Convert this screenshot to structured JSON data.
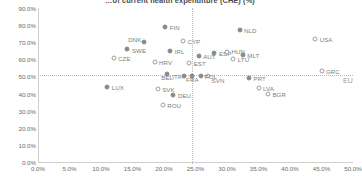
{
  "chart_data": {
    "type": "scatter",
    "title": "…of current health expenditure (CHE) (%)",
    "xlabel": "",
    "ylabel": "",
    "xlim": [
      0,
      50
    ],
    "ylim": [
      0,
      90
    ],
    "xticks": [
      "0.0%",
      "5.0%",
      "10.0%",
      "15.0%",
      "20.0%",
      "25.0%",
      "30.0%",
      "35.0%",
      "40.0%",
      "45.0%",
      "50.0%"
    ],
    "xtick_values": [
      0,
      5,
      10,
      15,
      20,
      25,
      30,
      35,
      40,
      45,
      50
    ],
    "yticks": [
      "0.0%",
      "10.0%",
      "20.0%",
      "30.0%",
      "40.0%",
      "50.0%",
      "60.0%",
      "70.0%",
      "80.0%",
      "90.0%"
    ],
    "ytick_values": [
      0,
      10,
      20,
      30,
      40,
      50,
      60,
      70,
      80,
      90
    ],
    "grid": false,
    "legend": "none",
    "reference_lines": [
      {
        "name": "eu-horizontal",
        "orientation": "horizontal",
        "value": 51.0,
        "label": "EU",
        "label_pos": "right"
      },
      {
        "name": "eu-vertical",
        "orientation": "vertical",
        "value": 24.5,
        "label": "",
        "label_pos": "top"
      }
    ],
    "points": [
      {
        "code": "FIN",
        "x": 20.2,
        "y": 79.0,
        "marker": "filled",
        "lx": 2.5,
        "ly": 0
      },
      {
        "code": "NLD",
        "x": 32.0,
        "y": 77.0,
        "marker": "filled",
        "lx": 2.5,
        "ly": 0
      },
      {
        "code": "USA",
        "x": 44.0,
        "y": 72.0,
        "marker": "hollow",
        "lx": 2.5,
        "ly": 0
      },
      {
        "code": "DNK",
        "x": 16.8,
        "y": 70.0,
        "marker": "filled",
        "lx": -2.5,
        "ly": -3.5,
        "anchor": "right"
      },
      {
        "code": "CYP",
        "x": 23.0,
        "y": 71.0,
        "marker": "hollow",
        "lx": 2.5,
        "ly": 0
      },
      {
        "code": "SWE",
        "x": 14.2,
        "y": 66.0,
        "marker": "filled",
        "lx": 2.5,
        "ly": 0.6
      },
      {
        "code": "IRL",
        "x": 21.0,
        "y": 65.0,
        "marker": "filled",
        "lx": 2.5,
        "ly": 0
      },
      {
        "code": "ESP",
        "x": 28.0,
        "y": 63.5,
        "marker": "filled",
        "lx": 2.5,
        "ly": 0
      },
      {
        "code": "HUN",
        "x": 30.0,
        "y": 64.5,
        "marker": "hollow",
        "lx": 2.5,
        "ly": -0.5
      },
      {
        "code": "MLT",
        "x": 32.5,
        "y": 62.5,
        "marker": "filled",
        "lx": 2.5,
        "ly": -0.5
      },
      {
        "code": "AUT",
        "x": 25.5,
        "y": 62.0,
        "marker": "filled",
        "lx": 2.5,
        "ly": 0
      },
      {
        "code": "CZE",
        "x": 12.0,
        "y": 61.0,
        "marker": "hollow",
        "lx": 2.5,
        "ly": 0
      },
      {
        "code": "LTU",
        "x": 31.0,
        "y": 60.0,
        "marker": "hollow",
        "lx": 2.5,
        "ly": 0
      },
      {
        "code": "HRV",
        "x": 18.5,
        "y": 58.5,
        "marker": "hollow",
        "lx": 2.5,
        "ly": 0
      },
      {
        "code": "EST",
        "x": 24.0,
        "y": 58.0,
        "marker": "hollow",
        "lx": 2.5,
        "ly": 0
      },
      {
        "code": "GRC",
        "x": 45.0,
        "y": 53.0,
        "marker": "hollow",
        "lx": 2.5,
        "ly": 0
      },
      {
        "code": "BEL",
        "x": 20.5,
        "y": 51.5,
        "marker": "filled",
        "lx": 0,
        "ly": 3.5,
        "anchor": "center"
      },
      {
        "code": "FRA",
        "x": 24.5,
        "y": 50.5,
        "marker": "filled",
        "lx": 0,
        "ly": 3.5,
        "anchor": "center"
      },
      {
        "code": "SVN",
        "x": 27.0,
        "y": 50.0,
        "marker": "hollow",
        "lx": 1.5,
        "ly": 3.5
      },
      {
        "code": "POL",
        "x": 25.8,
        "y": 50.3,
        "marker": "filled",
        "lx": 2.0,
        "ly": 0
      },
      {
        "code": "ITA",
        "x": 23.2,
        "y": 50.2,
        "marker": "filled",
        "lx": -2.5,
        "ly": 0,
        "anchor": "right"
      },
      {
        "code": "PRT",
        "x": 33.5,
        "y": 49.0,
        "marker": "filled",
        "lx": 2.5,
        "ly": 0
      },
      {
        "code": "LUX",
        "x": 11.0,
        "y": 44.0,
        "marker": "filled",
        "lx": 2.5,
        "ly": 0
      },
      {
        "code": "SVK",
        "x": 19.0,
        "y": 42.5,
        "marker": "hollow",
        "lx": 2.5,
        "ly": 0
      },
      {
        "code": "LVA",
        "x": 35.0,
        "y": 43.0,
        "marker": "hollow",
        "lx": 2.5,
        "ly": 0
      },
      {
        "code": "DEU",
        "x": 21.5,
        "y": 39.0,
        "marker": "filled",
        "lx": 2.5,
        "ly": 0
      },
      {
        "code": "BGR",
        "x": 36.5,
        "y": 40.0,
        "marker": "hollow",
        "lx": 2.5,
        "ly": 0
      },
      {
        "code": "ROU",
        "x": 19.8,
        "y": 33.5,
        "marker": "hollow",
        "lx": 2.5,
        "ly": 0
      }
    ]
  }
}
